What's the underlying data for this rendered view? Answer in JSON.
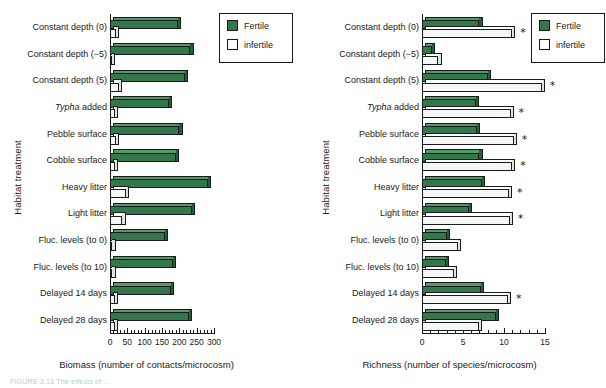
{
  "figure": {
    "caption_partial": "FIGURE 3.13  The effects of ...",
    "legend": {
      "fertile_label": "Fertile",
      "infertile_label": "infertile",
      "fertile_color": "#35774c",
      "infertile_color": "#fbfdfb"
    },
    "categories": [
      "Constant depth (0)",
      "Constant depth (−5)",
      "Constant depth (5)",
      "Typha added",
      "Pebble surface",
      "Cobble surface",
      "Heavy litter",
      "Light litter",
      "Fluc. levels (to 0)",
      "Fluc. levels (to 10)",
      "Delayed 14 days",
      "Delayed 28 days"
    ],
    "category_italic_prefix": {
      "3": "Typha"
    },
    "ylabel": "Habitat treatment"
  },
  "chart_data": [
    {
      "type": "bar",
      "id": "biomass",
      "orientation": "horizontal",
      "title": "",
      "xlabel": "Biomass (number of contacts/microcosm)",
      "ylabel": "Habitat treatment",
      "xlim": [
        0,
        300
      ],
      "xticks": [
        0,
        50,
        100,
        150,
        200,
        250,
        300
      ],
      "xticklabels": [
        "0",
        "50",
        "100",
        "150",
        "200",
        "250",
        "300"
      ],
      "minor_ticks": true,
      "grid": false,
      "legend_position": "top-right",
      "categories": [
        "Constant depth (0)",
        "Constant depth (−5)",
        "Constant depth (5)",
        "Typha added",
        "Pebble surface",
        "Cobble surface",
        "Heavy litter",
        "Light litter",
        "Fluc. levels (to 0)",
        "Fluc. levels (to 10)",
        "Delayed 14 days",
        "Delayed 28 days"
      ],
      "series": [
        {
          "name": "Fertile",
          "color": "#35774c",
          "values": [
            196,
            232,
            215,
            170,
            200,
            190,
            282,
            236,
            158,
            182,
            175,
            228
          ]
        },
        {
          "name": "infertile",
          "color": "#fbfdfb",
          "values": [
            16,
            6,
            25,
            14,
            16,
            14,
            46,
            36,
            7,
            7,
            14,
            14
          ]
        }
      ],
      "significance": []
    },
    {
      "type": "bar",
      "id": "richness",
      "orientation": "horizontal",
      "title": "",
      "xlabel": "Richness (number of species/microcosm)",
      "ylabel": "Habitat treatment",
      "xlim": [
        0,
        15
      ],
      "xticks": [
        0,
        5,
        10,
        15
      ],
      "xticklabels": [
        "0",
        "5",
        "10",
        "15"
      ],
      "minor_ticks": true,
      "grid": false,
      "legend_position": "top-right",
      "categories": [
        "Constant depth (0)",
        "Constant depth (−5)",
        "Constant depth (5)",
        "Typha added",
        "Pebble surface",
        "Cobble surface",
        "Heavy litter",
        "Light litter",
        "Fluc. levels (to 0)",
        "Fluc. levels (to 10)",
        "Delayed 14 days",
        "Delayed 28 days"
      ],
      "series": [
        {
          "name": "Fertile",
          "color": "#35774c",
          "values": [
            7.0,
            1.2,
            8.0,
            6.6,
            6.7,
            7.0,
            7.3,
            5.7,
            3.0,
            2.9,
            7.2,
            9.0
          ]
        },
        {
          "name": "infertile",
          "color": "#fbfdfb",
          "values": [
            11.0,
            2.0,
            14.6,
            10.8,
            11.2,
            11.0,
            10.6,
            10.7,
            4.4,
            3.9,
            10.5,
            6.9
          ]
        }
      ],
      "significance": [
        {
          "category": "Constant depth (0)",
          "marker": "*"
        },
        {
          "category": "Constant depth (5)",
          "marker": "*"
        },
        {
          "category": "Typha added",
          "marker": "*"
        },
        {
          "category": "Pebble surface",
          "marker": "*"
        },
        {
          "category": "Cobble surface",
          "marker": "*"
        },
        {
          "category": "Heavy litter",
          "marker": "*"
        },
        {
          "category": "Light litter",
          "marker": "*"
        },
        {
          "category": "Delayed 14 days",
          "marker": "*"
        }
      ]
    }
  ]
}
